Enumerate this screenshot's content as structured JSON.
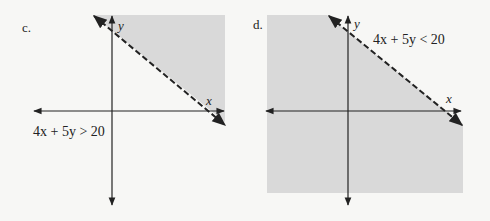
{
  "colors": {
    "background": "#f7f7f5",
    "shade": "#d9d9d9",
    "ink": "#222222"
  },
  "panels": [
    {
      "label": "c.",
      "inequality": {
        "left": "4x + 5y",
        "op": ">",
        "right": "20",
        "text": "4x + 5y > 20"
      },
      "axis_x_label": "x",
      "axis_y_label": "y",
      "boundary": "dashed",
      "shaded_side": "above"
    },
    {
      "label": "d.",
      "inequality": {
        "left": "4x + 5y",
        "op": "<",
        "right": "20",
        "text": "4x + 5y < 20"
      },
      "axis_x_label": "x",
      "axis_y_label": "y",
      "boundary": "dashed",
      "shaded_side": "below"
    }
  ]
}
